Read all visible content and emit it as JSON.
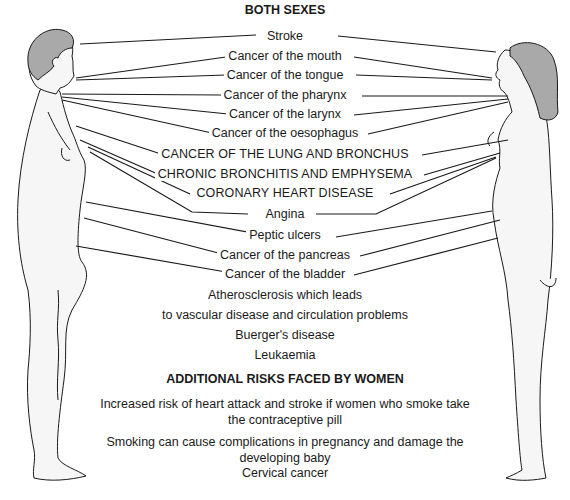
{
  "colors": {
    "line": "#1a1a1a",
    "hair": "#a9a9a9",
    "skin": "#f6f6f6",
    "background": "#ffffff"
  },
  "sections": {
    "both_sexes": {
      "heading": "BOTH SEXES",
      "items": [
        "Stroke",
        "Cancer of the mouth",
        "Cancer of the tongue",
        "Cancer of the pharynx",
        "Cancer of the larynx",
        "Cancer of the oesophagus",
        "CANCER OF THE LUNG AND BRONCHUS",
        "CHRONIC BRONCHITIS AND EMPHYSEMA",
        "CORONARY HEART DISEASE",
        "Angina",
        "Peptic ulcers",
        "Cancer of the pancreas",
        "Cancer of the bladder",
        "Atherosclerosis which leads",
        "to vascular disease and circulation problems",
        "Buerger's disease",
        "Leukaemia"
      ]
    },
    "women": {
      "heading": "ADDITIONAL RISKS FACED BY WOMEN",
      "items": [
        "Increased risk of heart attack and stroke if women who smoke take",
        "the contraceptive pill",
        "Smoking can cause complications in pregnancy and damage the",
        "developing baby",
        "Cervical cancer"
      ]
    }
  },
  "figures": {
    "left": "male-figure",
    "right": "female-figure"
  }
}
